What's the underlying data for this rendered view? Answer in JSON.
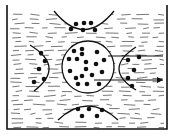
{
  "title": "",
  "colors": {
    "ink": "#111111",
    "background": "#ffffff",
    "liquid_dash": "#555555"
  },
  "container": {
    "left_x": 7,
    "right_x": 167,
    "top_y": 5,
    "bottom_y": 129
  },
  "central_circle": {
    "cx": 88,
    "cy": 67,
    "r": 26,
    "molecules": [
      [
        74,
        51
      ],
      [
        82,
        49
      ],
      [
        82,
        54
      ],
      [
        97,
        52
      ],
      [
        104,
        60
      ],
      [
        69,
        59
      ],
      [
        77,
        59
      ],
      [
        86,
        62
      ],
      [
        96,
        64
      ],
      [
        70,
        71
      ],
      [
        86,
        69
      ],
      [
        102,
        72
      ],
      [
        92,
        75
      ],
      [
        76,
        78
      ],
      [
        78,
        84
      ],
      [
        87,
        84
      ],
      [
        99,
        84
      ],
      [
        82,
        76
      ]
    ]
  },
  "top_group": {
    "cx": 84,
    "cy": 20,
    "r": 30,
    "molecules": [
      [
        76,
        24
      ],
      [
        84,
        23
      ],
      [
        91,
        23
      ],
      [
        71,
        29
      ],
      [
        83,
        30
      ],
      [
        95,
        30
      ]
    ]
  },
  "bottom_group": {
    "cx": 88,
    "cy": 118,
    "r": 30,
    "molecules": [
      [
        78,
        109
      ],
      [
        89,
        109
      ],
      [
        102,
        110
      ],
      [
        82,
        116
      ],
      [
        97,
        116
      ]
    ]
  },
  "left_group": {
    "cx": 34,
    "cy": 67,
    "r": 22,
    "molecules": [
      [
        41,
        53
      ],
      [
        45,
        61
      ],
      [
        39,
        69
      ],
      [
        44,
        79
      ],
      [
        34,
        82
      ]
    ]
  },
  "right_group": {
    "cx": 143,
    "cy": 67,
    "r": 22,
    "molecules": [
      [
        139,
        57
      ],
      [
        128,
        60
      ],
      [
        134,
        70
      ],
      [
        128,
        78
      ],
      [
        132,
        86
      ]
    ]
  },
  "arrows": [
    {
      "from": [
        108,
        56
      ],
      "to": [
        163,
        56
      ],
      "head": false
    },
    {
      "from": [
        94,
        80
      ],
      "to": [
        163,
        80
      ],
      "head": true
    }
  ]
}
